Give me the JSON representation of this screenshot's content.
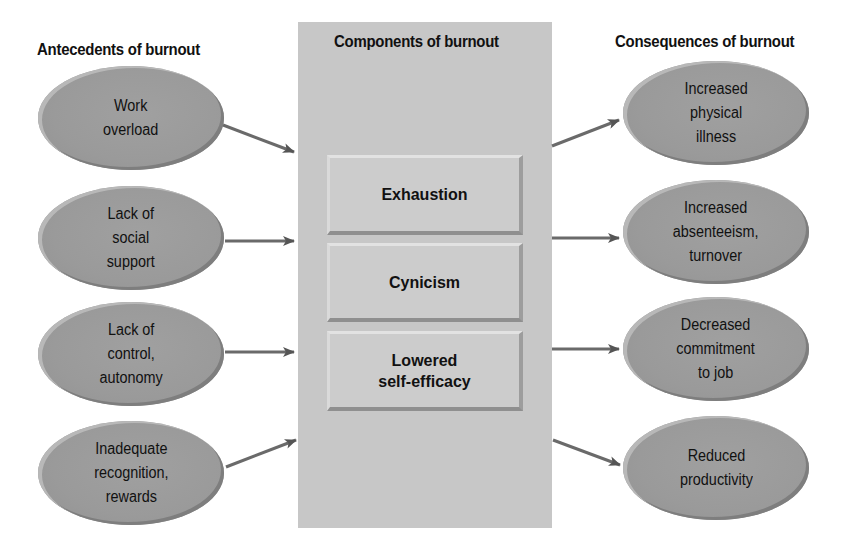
{
  "headings": {
    "antecedents": "Antecedents of burnout",
    "components": "Components of burnout",
    "consequences": "Consequences of burnout"
  },
  "antecedents": [
    {
      "label": "Work\noverload"
    },
    {
      "label": "Lack of\nsocial\nsupport"
    },
    {
      "label": "Lack of\ncontrol,\nautonomy"
    },
    {
      "label": "Inadequate\nrecognition,\nrewards"
    }
  ],
  "components": [
    {
      "label": "Exhaustion"
    },
    {
      "label": "Cynicism"
    },
    {
      "label": "Lowered\nself-efficacy"
    }
  ],
  "consequences": [
    {
      "label": "Increased\nphysical\nillness"
    },
    {
      "label": "Increased\nabsenteeism,\nturnover"
    },
    {
      "label": "Decreased\ncommitment\nto job"
    },
    {
      "label": "Reduced\nproductivity"
    }
  ],
  "colors": {
    "ellipse_fill": "#9a9a9a",
    "panel_fill": "#c7c7c7",
    "box_fill": "#cccccc",
    "arrow": "#555555"
  }
}
